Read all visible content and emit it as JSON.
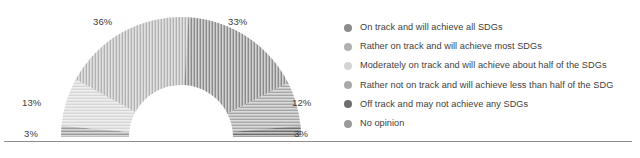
{
  "chart_data": {
    "type": "pie",
    "variant": "semi-donut",
    "title": "",
    "subtitle": "",
    "xlabel": "",
    "ylabel": "",
    "grid": false,
    "legend_position": "right",
    "total": 100,
    "unit": "%",
    "categories": [
      "On track and will achieve all SDGs",
      "Rather on track and will achieve most SDGs",
      "Moderately on track and will achieve about half of the SDGs",
      "Rather not on track and will achieve less than half of the SDG",
      "Off track and may not achieve any SDGs",
      "No opinion"
    ],
    "values": [
      33,
      36,
      13,
      12,
      3,
      3
    ],
    "slices": [
      {
        "label": "On track and will achieve all SDGs",
        "value": 33,
        "display": "33%",
        "color": "#8c8c8c"
      },
      {
        "label": "Rather on track and will achieve most SDGs",
        "value": 36,
        "display": "36%",
        "color": "#b3b3b3"
      },
      {
        "label": "Moderately on track and will achieve about half of the SDGs",
        "value": 13,
        "display": "13%",
        "color": "#d6d6d6"
      },
      {
        "label": "Rather not on track and will achieve less than half of the SDG",
        "value": 12,
        "display": "12%",
        "color": "#a6a6a6"
      },
      {
        "label": "Off track and may not achieve any SDGs",
        "value": 3,
        "display": "3%",
        "color": "#6e6e6e"
      },
      {
        "label": "No opinion",
        "value": 3,
        "display": "3%",
        "color": "#9a9a9a"
      }
    ],
    "data_labels": [
      {
        "name": "label-36",
        "text": "36%"
      },
      {
        "name": "label-33",
        "text": "33%"
      },
      {
        "name": "label-13",
        "text": "13%"
      },
      {
        "name": "label-12",
        "text": "12%"
      },
      {
        "name": "label-3-left",
        "text": "3%"
      },
      {
        "name": "label-3-right",
        "text": "3%"
      }
    ]
  },
  "legend": {
    "items": [
      {
        "label": "On track and will achieve all SDGs",
        "color": "#8c8c8c",
        "swatch": "circle-swatch"
      },
      {
        "label": "Rather on track and will achieve most SDGs",
        "color": "#b0b0b0",
        "swatch": "circle-swatch"
      },
      {
        "label": "Moderately on track and will achieve about half of the SDGs",
        "color": "#d4d4d4",
        "swatch": "circle-swatch"
      },
      {
        "label": "Rather not on track and will achieve less than half of the SDG",
        "color": "#a8a8a8",
        "swatch": "circle-swatch"
      },
      {
        "label": "Off track and may not achieve any SDGs",
        "color": "#6e6e6e",
        "swatch": "circle-swatch"
      },
      {
        "label": "No opinion",
        "color": "#9a9a9a",
        "swatch": "circle-swatch"
      }
    ]
  },
  "colors": {
    "text": "#3d3d3d",
    "rule": "#8d8d8d",
    "background": "#ffffff"
  }
}
